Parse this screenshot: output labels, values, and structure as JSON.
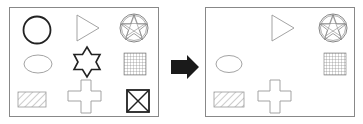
{
  "diagram": {
    "type": "before-after shape transformation",
    "left_panel": {
      "label": "before",
      "shapes": [
        {
          "name": "circle",
          "row": 1,
          "col": 1,
          "style": "bold outline"
        },
        {
          "name": "triangle",
          "row": 1,
          "col": 2,
          "style": "thin outline, pointing right"
        },
        {
          "name": "star-in-circle",
          "row": 1,
          "col": 3,
          "style": "thin outline"
        },
        {
          "name": "ellipse",
          "row": 2,
          "col": 1,
          "style": "thin outline"
        },
        {
          "name": "six-point-star",
          "row": 2,
          "col": 2,
          "style": "bold outline"
        },
        {
          "name": "grid-square",
          "row": 2,
          "col": 3,
          "style": "hatched grid"
        },
        {
          "name": "hatched-rectangle",
          "row": 3,
          "col": 1,
          "style": "diagonal hatch"
        },
        {
          "name": "cross",
          "row": 3,
          "col": 2,
          "style": "thin outline"
        },
        {
          "name": "x-box",
          "row": 3,
          "col": 3,
          "style": "bold outline"
        }
      ]
    },
    "arrow": {
      "direction": "right",
      "color": "#1a1a1a"
    },
    "right_panel": {
      "label": "after",
      "shapes": [
        {
          "name": "triangle",
          "row": 1,
          "col": 2
        },
        {
          "name": "star-in-circle",
          "row": 1,
          "col": 3
        },
        {
          "name": "ellipse",
          "row": 2,
          "col": 1
        },
        {
          "name": "grid-square",
          "row": 2,
          "col": 3
        },
        {
          "name": "hatched-rectangle",
          "row": 3,
          "col": 1
        },
        {
          "name": "cross",
          "row": 3,
          "col": 2
        }
      ],
      "removed": [
        "circle",
        "six-point-star",
        "x-box"
      ]
    },
    "colors": {
      "bold": "#222222",
      "thin": "#999999",
      "border": "#888888"
    }
  }
}
